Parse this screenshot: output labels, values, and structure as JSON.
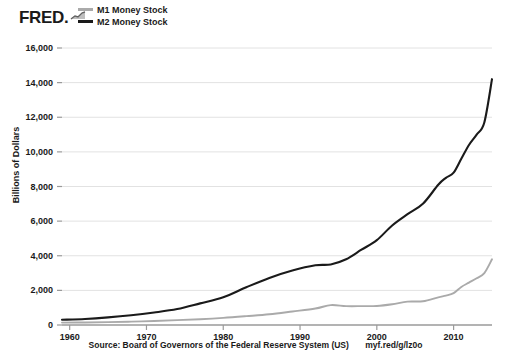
{
  "brand": {
    "name": "FRED",
    "dot": ".",
    "spark_icon": "sparkline-icon"
  },
  "legend": {
    "position": "top-left",
    "items": [
      {
        "label": "M1 Money Stock",
        "color": "#aaaaaa"
      },
      {
        "label": "M2 Money Stock",
        "color": "#1a1a1a"
      }
    ]
  },
  "footer": {
    "source": "Source: Board of Governors of the Federal Reserve System (US)",
    "url": "myf.red/g/lz0o"
  },
  "chart_data": {
    "type": "line",
    "title": "",
    "subtitle": "",
    "xlabel": "",
    "ylabel": "Billions of Dollars",
    "xlim": [
      1959,
      2015
    ],
    "ylim": [
      0,
      16000
    ],
    "grid": true,
    "legend_position": "top-left",
    "ytick_labels": [
      "0",
      "2,000",
      "4,000",
      "6,000",
      "8,000",
      "10,000",
      "12,000",
      "14,000",
      "16,000"
    ],
    "ytick_values": [
      0,
      2000,
      4000,
      6000,
      8000,
      10000,
      12000,
      14000,
      16000
    ],
    "xtick_labels": [
      "1960",
      "1970",
      "1980",
      "1990",
      "2000",
      "2010"
    ],
    "xtick_values": [
      1960,
      1970,
      1980,
      1990,
      2000,
      2010
    ],
    "annotations": [
      "M1 flat near 1,100-1,400 through 1995-2008, then steep rise after 2008",
      "M2 shows a visible step-up acceleration around 2008-2009"
    ],
    "series": [
      {
        "name": "M1 Money Stock",
        "color": "#aaaaaa",
        "x": [
          1959,
          1962,
          1965,
          1968,
          1971,
          1974,
          1977,
          1980,
          1983,
          1986,
          1989,
          1992,
          1994,
          1996,
          1998,
          2000,
          2002,
          2004,
          2006,
          2008,
          2009,
          2010,
          2011,
          2012,
          2013,
          2014,
          2015
        ],
        "values": [
          140,
          148,
          165,
          195,
          230,
          280,
          335,
          410,
          510,
          620,
          780,
          950,
          1150,
          1090,
          1090,
          1100,
          1200,
          1350,
          1370,
          1600,
          1700,
          1840,
          2200,
          2450,
          2700,
          3000,
          3800
        ]
      },
      {
        "name": "M2 Money Stock",
        "color": "#1a1a1a",
        "x": [
          1959,
          1962,
          1965,
          1968,
          1971,
          1974,
          1977,
          1980,
          1983,
          1986,
          1989,
          1992,
          1994,
          1996,
          1998,
          2000,
          2002,
          2004,
          2006,
          2008,
          2009,
          2010,
          2011,
          2012,
          2013,
          2014,
          2015
        ],
        "values": [
          300,
          350,
          440,
          560,
          720,
          920,
          1250,
          1600,
          2180,
          2720,
          3150,
          3450,
          3500,
          3800,
          4350,
          4900,
          5750,
          6400,
          7000,
          8100,
          8500,
          8800,
          9600,
          10400,
          11000,
          11700,
          14200
        ]
      }
    ]
  }
}
